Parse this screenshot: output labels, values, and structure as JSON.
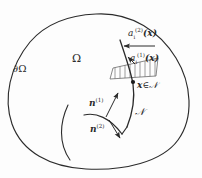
{
  "figure": {
    "width": 202,
    "height": 178,
    "background_color": "#fdfdfd",
    "stroke_color": "#2b2b2b"
  },
  "labels": {
    "omega": "Ω",
    "boundary_omega": "∂Ω",
    "a_upper_2": {
      "base": "a",
      "sub": "i",
      "sup": "(2)",
      "arg": "(𝒙)",
      "full": "a_i^(2)(x)"
    },
    "a_upper_1": {
      "base": "a",
      "sub": "i",
      "sup": "(1)",
      "arg": "(𝒙)",
      "full": "a_i^(1)(x)"
    },
    "point_in_set": {
      "point": "𝒙",
      "relation": "∈",
      "set": "𝒩",
      "full": "x ∈ N"
    },
    "normal_1": {
      "base": "n",
      "sup": "(1)",
      "full": "n^(1)"
    },
    "normal_2": {
      "base": "n",
      "sup": "(2)",
      "full": "n^(2)"
    },
    "interface": "𝒩"
  },
  "geometry": {
    "outer_boundary_name": "domain-outline",
    "interface_curve_name": "interface-curve",
    "crack_curve_name": "interior-crack",
    "hatched_strip_name": "hatched-strip",
    "hatch_line_count": 9,
    "marker_point": {
      "x": 133,
      "y": 82
    },
    "arrows": [
      {
        "name": "a2-arrow",
        "direction": "left",
        "from": [
          155,
          46
        ],
        "to": [
          124,
          46
        ]
      },
      {
        "name": "a1-arrow",
        "direction": "upper-left",
        "from": [
          134,
          63
        ],
        "to": [
          127,
          57
        ]
      },
      {
        "name": "n1-arrow",
        "direction": "upper-right",
        "from": [
          107,
          117
        ],
        "to": [
          119,
          94
        ]
      },
      {
        "name": "n2-arrow",
        "direction": "lower-right",
        "from": [
          110,
          120
        ],
        "to": [
          121,
          137
        ]
      }
    ]
  }
}
